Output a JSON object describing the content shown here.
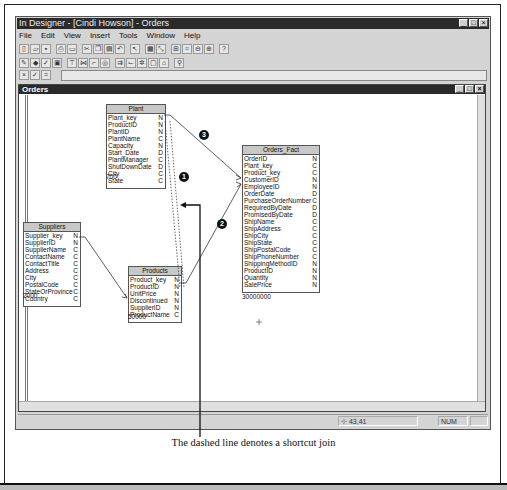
{
  "app": {
    "title": "In Designer - [Cindi Howson] - Orders",
    "menu": [
      "File",
      "Edit",
      "View",
      "Insert",
      "Tools",
      "Window",
      "Help"
    ],
    "window_buttons": [
      "_",
      "□",
      "×"
    ]
  },
  "toolbar1": [
    "new",
    "open",
    "save",
    "print",
    "preview",
    "cut",
    "copy",
    "paste",
    "undo",
    "select",
    "table",
    "join",
    "structure",
    "zoom-out",
    "zoom-in",
    "help"
  ],
  "toolbar2": [
    "universe-params",
    "classes",
    "check",
    "save-universe",
    "insert-table",
    "detect",
    "graph",
    "view",
    "cardinality",
    "contexts",
    "loops",
    "aliases",
    "refresh"
  ],
  "formula_bar": {
    "buttons": [
      "×",
      "✓",
      "="
    ],
    "value": ""
  },
  "document": {
    "title": "Orders",
    "tables": [
      {
        "name": "Plant",
        "rows": [
          [
            "Plant_key",
            "N"
          ],
          [
            "ProductID",
            "N"
          ],
          [
            "PlantID",
            "N"
          ],
          [
            "PlantName",
            "C"
          ],
          [
            "Capacity",
            "N"
          ],
          [
            "Start_Date",
            "D"
          ],
          [
            "PlantManager",
            "C"
          ],
          [
            "ShutDownDate",
            "D"
          ],
          [
            "City",
            "C"
          ],
          [
            "State",
            "C"
          ]
        ],
        "count": "700"
      },
      {
        "name": "Orders_Fact",
        "rows": [
          [
            "OrderID",
            "N"
          ],
          [
            "Plant_key",
            "C"
          ],
          [
            "Product_key",
            "C"
          ],
          [
            "CustomerID",
            "N"
          ],
          [
            "EmployeeID",
            "N"
          ],
          [
            "OrderDate",
            "D"
          ],
          [
            "PurchaseOrderNumber",
            "C"
          ],
          [
            "RequiredByDate",
            "D"
          ],
          [
            "PromisedByDate",
            "D"
          ],
          [
            "ShipName",
            "C"
          ],
          [
            "ShipAddress",
            "C"
          ],
          [
            "ShipCity",
            "C"
          ],
          [
            "ShipState",
            "C"
          ],
          [
            "ShipPostalCode",
            "C"
          ],
          [
            "ShipPhoneNumber",
            "C"
          ],
          [
            "ShippingMethodID",
            "N"
          ],
          [
            "ProductID",
            "N"
          ],
          [
            "Quantity",
            "N"
          ],
          [
            "SalePrice",
            "N"
          ]
        ],
        "count": "30000000"
      },
      {
        "name": "Suppliers",
        "rows": [
          [
            "Supplier_key",
            "N"
          ],
          [
            "SupplierID",
            "N"
          ],
          [
            "SupplierName",
            "C"
          ],
          [
            "ContactName",
            "C"
          ],
          [
            "ContactTitle",
            "C"
          ],
          [
            "Address",
            "C"
          ],
          [
            "City",
            "C"
          ],
          [
            "PostalCode",
            "C"
          ],
          [
            "StateOrProvince",
            "C"
          ],
          [
            "Country",
            "C"
          ]
        ],
        "count": "2000"
      },
      {
        "name": "Products",
        "rows": [
          [
            "Product_key",
            "N"
          ],
          [
            "ProductID",
            "N"
          ],
          [
            "UnitPrice",
            "N"
          ],
          [
            "Discontinued",
            "N"
          ],
          [
            "SupplierID",
            "N"
          ],
          [
            "ProductName",
            "C"
          ]
        ],
        "count": "50000"
      }
    ],
    "callouts": [
      "1",
      "2",
      "3"
    ]
  },
  "status": {
    "coords": "43,41",
    "num": "NUM"
  },
  "caption": "The dashed line denotes a shortcut join"
}
